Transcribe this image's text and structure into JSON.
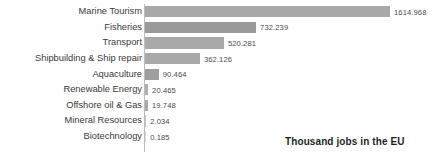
{
  "chart_data": {
    "type": "bar",
    "orientation": "horizontal",
    "title": "",
    "subtitle": "",
    "xlabel": "",
    "ylabel": "",
    "annotation": "Thousand jobs in the EU",
    "grid": false,
    "legend": "none",
    "xlim": [
      0,
      1614.968
    ],
    "categories": [
      "Marine Tourism",
      "Fisheries",
      "Transport",
      "Shipbuilding & Ship repair",
      "Aquaculture",
      "Renewable Energy",
      "Offshore oil & Gas",
      "Mineral Resources",
      "Biotechnology"
    ],
    "values": [
      1614.968,
      732.239,
      520.281,
      362.126,
      90.464,
      20.465,
      19.748,
      2.034,
      0.185
    ],
    "value_labels": [
      "1614.968",
      "732.239",
      "520.281",
      "362.126",
      "90.464",
      "20.465",
      "19.748",
      "2.034",
      "0.185"
    ],
    "bar_colors": [
      "#a8a8a8",
      "#9a9a9a",
      "#a9a9a9",
      "#a9a9a9",
      "#9e9e9e",
      "#b0b0b0",
      "#aaaaaa",
      "#c9c9c9",
      "#d8d8d8"
    ],
    "axis_color": "#bdbdbd",
    "label_color": "#3a3a3a",
    "value_color": "#4a4a4a"
  }
}
